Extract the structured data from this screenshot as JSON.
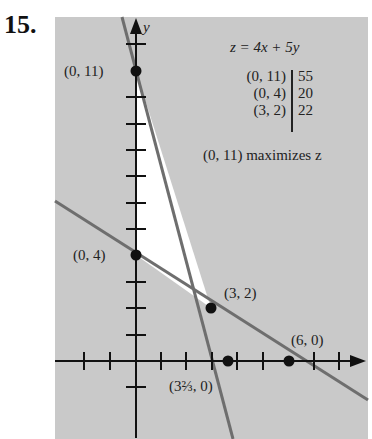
{
  "problem": {
    "number": "15."
  },
  "graph": {
    "axis_y_label": "y",
    "points": [
      {
        "label": "(0, 11)",
        "x": 0,
        "y": 11
      },
      {
        "label": "(0, 4)",
        "x": 0,
        "y": 4
      },
      {
        "label": "(3, 2)",
        "x": 3,
        "y": 2
      },
      {
        "label": "(3⅔, 0)",
        "x": 3.6667,
        "y": 0
      },
      {
        "label": "(6, 0)",
        "x": 6,
        "y": 0
      }
    ],
    "boundary_lines": [
      {
        "through": [
          [
            0,
            11
          ],
          [
            3.6667,
            0
          ]
        ],
        "equation": "3x + y = 11"
      },
      {
        "through": [
          [
            0,
            4
          ],
          [
            6,
            0
          ]
        ],
        "equation": "2x + 3y = 12"
      }
    ],
    "feasible_region_vertices": [
      "(0, 11)",
      "(0, 4)",
      "(3, 2)"
    ]
  },
  "objective": {
    "equation": "z = 4x + 5y",
    "table": [
      {
        "point": "(0, 11)",
        "value": "55"
      },
      {
        "point": "(0, 4)",
        "value": "20"
      },
      {
        "point": "(3, 2)",
        "value": "22"
      }
    ],
    "conclusion": "(0, 11) maximizes z"
  },
  "colors": {
    "shade": "#c9c9c9",
    "line": "#6e6e6e",
    "axis": "#111111",
    "region": "#ffffff"
  }
}
